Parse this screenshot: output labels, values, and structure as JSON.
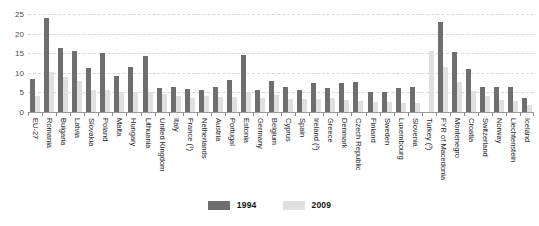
{
  "chart_data": {
    "type": "bar",
    "title": "",
    "subtitle": "",
    "xlabel": "",
    "ylabel": "",
    "ylim": [
      0,
      25
    ],
    "yticks": [
      0,
      5,
      10,
      15,
      20,
      25
    ],
    "ytick_labels": [
      "0",
      "5",
      "10",
      "15",
      "20",
      "25"
    ],
    "grid": true,
    "legend_position": "bottom-center",
    "categories": [
      "EU-27",
      "Romania",
      "Bulgaria",
      "Latvia",
      "Slovakia",
      "Poland",
      "Malta",
      "Hungary",
      "Lithuania",
      "United Kingdom",
      "Italy",
      "France (¹)",
      "Netherlands",
      "Austria",
      "Portugal",
      "Estonia",
      "Germany",
      "Belgium",
      "Cyprus",
      "Spain",
      "Ireland (²)",
      "Greece",
      "Denmark",
      "Czech Republic",
      "Finland",
      "Sweden",
      "Luxembourg",
      "Slovenia",
      "Turkey (³)",
      "FYR of Macedonia",
      "Montenegro",
      "Croatia",
      "Switzerland",
      "Norway",
      "Liechtenstein",
      "Iceland"
    ],
    "series": [
      {
        "name": "1994",
        "color": "#6e6e6e",
        "values": [
          8.3,
          23.9,
          16.3,
          15.6,
          11.2,
          15.1,
          9.2,
          11.6,
          14.3,
          6.2,
          6.5,
          5.9,
          5.7,
          6.4,
          8.1,
          14.5,
          5.7,
          7.8,
          6.4,
          5.7,
          7.5,
          6.1,
          7.3,
          7.6,
          5.0,
          5.0,
          6.2,
          6.4,
          null,
          22.9,
          15.3,
          11.0,
          6.5,
          6.4,
          6.4,
          3.6
        ]
      },
      {
        "name": "2009",
        "color": "#e0e0e0",
        "values": [
          4.1,
          10.2,
          9.0,
          7.8,
          5.6,
          5.5,
          5.1,
          5.2,
          5.1,
          4.7,
          4.1,
          3.7,
          4.0,
          3.9,
          3.8,
          5.0,
          3.5,
          4.3,
          3.3,
          3.4,
          3.2,
          3.6,
          3.1,
          2.9,
          2.6,
          2.5,
          2.4,
          2.4,
          15.6,
          11.5,
          7.7,
          5.3,
          4.2,
          3.0,
          2.8,
          1.8
        ]
      }
    ]
  },
  "legend": {
    "items": [
      {
        "label": "1994",
        "color": "#6e6e6e"
      },
      {
        "label": "2009",
        "color": "#e0e0e0"
      }
    ]
  }
}
